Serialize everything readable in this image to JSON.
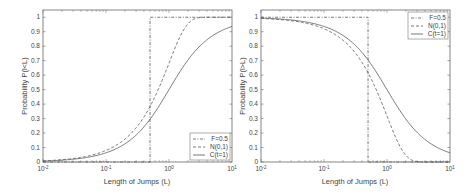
{
  "chart_data": [
    {
      "type": "line",
      "xscale": "log",
      "xlim": [
        0.01,
        10
      ],
      "ylim": [
        0,
        1.05
      ],
      "xlabel": "Length of Jumps (L)",
      "ylabel": "Probability P(l<L)",
      "xticks": [
        0.01,
        0.1,
        1,
        10
      ],
      "xtick_labels": [
        "10^-2",
        "10^-1",
        "10^0",
        "10^1"
      ],
      "yticks": [
        0,
        0.1,
        0.2,
        0.3,
        0.4,
        0.5,
        0.6,
        0.7,
        0.8,
        0.9,
        1
      ],
      "ytick_labels": [
        "0",
        "0.1",
        "0.2",
        "0.3",
        "0.4",
        "0.5",
        "0.6",
        "0.7",
        "0.8",
        "0.9",
        "1"
      ],
      "grid": false,
      "legend_position": "lower right",
      "x": [
        0.01,
        0.02,
        0.05,
        0.1,
        0.2,
        0.3,
        0.5,
        0.7,
        1,
        1.5,
        2,
        3,
        5,
        7,
        10
      ],
      "series": [
        {
          "name": "F=0.5",
          "style": "dash-dot",
          "values": [
            0,
            0,
            0,
            0,
            0,
            0,
            1,
            1,
            1,
            1,
            1,
            1,
            1,
            1,
            1
          ]
        },
        {
          "name": "N(0,1)",
          "style": "dashed",
          "values": [
            0.008,
            0.016,
            0.04,
            0.08,
            0.159,
            0.236,
            0.383,
            0.516,
            0.683,
            0.866,
            0.954,
            0.997,
            1,
            1,
            1
          ]
        },
        {
          "name": "C(t=1)",
          "style": "solid",
          "values": [
            0.006,
            0.013,
            0.032,
            0.063,
            0.126,
            0.186,
            0.295,
            0.389,
            0.5,
            0.626,
            0.705,
            0.795,
            0.874,
            0.91,
            0.937
          ]
        }
      ]
    },
    {
      "type": "line",
      "xscale": "log",
      "xlim": [
        0.01,
        10
      ],
      "ylim": [
        0,
        1.05
      ],
      "xlabel": "Length of Jumps (L)",
      "ylabel": "Probability P(l>L)",
      "xticks": [
        0.01,
        0.1,
        1,
        10
      ],
      "xtick_labels": [
        "10^-2",
        "10^-1",
        "10^0",
        "10^1"
      ],
      "yticks": [
        0,
        0.1,
        0.2,
        0.3,
        0.4,
        0.5,
        0.6,
        0.7,
        0.8,
        0.9,
        1
      ],
      "ytick_labels": [
        "0",
        "0.1",
        "0.2",
        "0.3",
        "0.4",
        "0.5",
        "0.6",
        "0.7",
        "0.8",
        "0.9",
        "1"
      ],
      "grid": false,
      "legend_position": "upper right",
      "x": [
        0.01,
        0.02,
        0.05,
        0.1,
        0.2,
        0.3,
        0.5,
        0.7,
        1,
        1.5,
        2,
        3,
        5,
        7,
        10
      ],
      "series": [
        {
          "name": "F=0.5",
          "style": "dash-dot",
          "values": [
            1,
            1,
            1,
            1,
            1,
            1,
            0,
            0,
            0,
            0,
            0,
            0,
            0,
            0,
            0
          ]
        },
        {
          "name": "N(0,1)",
          "style": "dashed",
          "values": [
            0.992,
            0.984,
            0.96,
            0.92,
            0.841,
            0.764,
            0.617,
            0.484,
            0.317,
            0.134,
            0.046,
            0.003,
            0,
            0,
            0
          ]
        },
        {
          "name": "C(t=1)",
          "style": "solid",
          "values": [
            0.994,
            0.987,
            0.968,
            0.937,
            0.874,
            0.814,
            0.705,
            0.611,
            0.5,
            0.374,
            0.295,
            0.205,
            0.126,
            0.09,
            0.063
          ]
        }
      ]
    }
  ],
  "plots": [
    {
      "xlabel": "Length of Jumps (L)",
      "ylabel": "Probability P(l<L)",
      "legend": [
        "F=0.5",
        "N(0,1)",
        "C(t=1)"
      ]
    },
    {
      "xlabel": "Length of Jumps (L)",
      "ylabel": "Probability P(l>L)",
      "legend": [
        "F=0.5",
        "N(0,1)",
        "C(t=1)"
      ]
    }
  ],
  "colors": {
    "axis": "#555555",
    "curve": "#555555",
    "text": "#444444"
  }
}
